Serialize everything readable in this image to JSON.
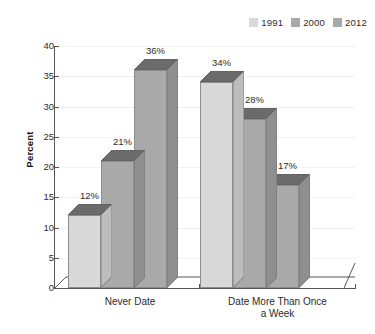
{
  "chart_data": {
    "type": "bar",
    "title": "",
    "subtitle": "",
    "xlabel": "",
    "ylabel": "Percent",
    "ylim": [
      0,
      40
    ],
    "ytick_step": 5,
    "yticks": [
      "0",
      "5",
      "10",
      "15",
      "20",
      "25",
      "30",
      "35",
      "40"
    ],
    "grid": true,
    "grid_axis": "y",
    "legend_position": "top-right",
    "style": "3d-column",
    "categories": [
      "Never Date",
      "Date More Than Once a Week"
    ],
    "category_lines": [
      [
        "Never Date"
      ],
      [
        "Date More Than Once",
        "a Week"
      ]
    ],
    "series": [
      {
        "name": "1991",
        "color": "#d9d9d9",
        "values": [
          12,
          34
        ],
        "labels": [
          "12%",
          "34%"
        ]
      },
      {
        "name": "2000",
        "color": "#a9a9a9",
        "values": [
          21,
          28
        ],
        "labels": [
          "21%",
          "28%"
        ]
      },
      {
        "name": "2012",
        "color": "#a9a9a9",
        "values": [
          36,
          17
        ],
        "labels": [
          "36%",
          "17%"
        ]
      }
    ],
    "value_unit": "%",
    "data_labels": [
      {
        "category": "Never Date",
        "series": "1991",
        "value": 12,
        "text": "12%"
      },
      {
        "category": "Never Date",
        "series": "2000",
        "value": 21,
        "text": "21%"
      },
      {
        "category": "Never Date",
        "series": "2012",
        "value": 36,
        "text": "36%"
      },
      {
        "category": "Date More Than Once a Week",
        "series": "1991",
        "value": 34,
        "text": "34%"
      },
      {
        "category": "Date More Than Once a Week",
        "series": "2000",
        "value": 28,
        "text": "28%"
      },
      {
        "category": "Date More Than Once a Week",
        "series": "2012",
        "value": 17,
        "text": "17%"
      }
    ]
  },
  "legend": {
    "items": [
      {
        "label": "1991",
        "color": "#d9d9d9"
      },
      {
        "label": "2000",
        "color": "#a9a9a9"
      },
      {
        "label": "2012",
        "color": "#a9a9a9"
      }
    ]
  },
  "axes": {
    "y_title": "Percent",
    "y_ticks": [
      "40",
      "35",
      "30",
      "25",
      "20",
      "15",
      "10",
      "5",
      "0"
    ]
  },
  "colors": {
    "bar_front_light": "#d9d9d9",
    "bar_front_dark": "#a9a9a9",
    "bar_top": "#6b6b6b",
    "bar_side_light": "#bdbdbd",
    "bar_side_dark": "#8f8f8f",
    "axis": "#555555",
    "gridline": "#f1f1f1",
    "text": "#2b2b2b",
    "background": "#ffffff"
  }
}
